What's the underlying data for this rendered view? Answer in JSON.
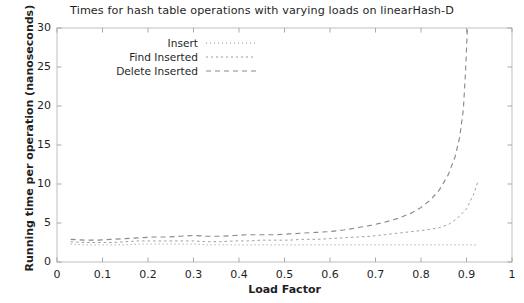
{
  "chart_data": {
    "type": "line",
    "title": "Times for hash table operations with varying loads on linearHash-D",
    "xlabel": "Load Factor",
    "ylabel": "Running time per operation (nanoseconds)",
    "xlim": [
      0,
      1
    ],
    "ylim": [
      0,
      30
    ],
    "xticks": [
      "0",
      "0.1",
      "0.2",
      "0.3",
      "0.4",
      "0.5",
      "0.6",
      "0.7",
      "0.8",
      "0.9",
      "1"
    ],
    "xtick_values": [
      0,
      0.1,
      0.2,
      0.3,
      0.4,
      0.5,
      0.6,
      0.7,
      0.8,
      0.9,
      1
    ],
    "yticks": [
      "0",
      "5",
      "10",
      "15",
      "20",
      "25",
      "30"
    ],
    "ytick_values": [
      0,
      5,
      10,
      15,
      20,
      25,
      30
    ],
    "grid": false,
    "legend_position": "upper-left",
    "legend": [
      "Insert",
      "Find Inserted",
      "Delete Inserted"
    ],
    "series": [
      {
        "name": "Insert",
        "style": "dotted",
        "color": "#8d8d8d",
        "x": [
          0.03,
          0.06,
          0.09,
          0.12,
          0.15,
          0.18,
          0.21,
          0.24,
          0.27,
          0.3,
          0.33,
          0.36,
          0.39,
          0.42,
          0.45,
          0.48,
          0.51,
          0.54,
          0.57,
          0.6,
          0.63,
          0.66,
          0.69,
          0.72,
          0.75,
          0.78,
          0.81,
          0.84,
          0.87,
          0.9,
          0.92
        ],
        "values": [
          2.3,
          2.2,
          2.2,
          2.2,
          2.2,
          2.3,
          2.3,
          2.3,
          2.3,
          2.3,
          2.2,
          2.2,
          2.2,
          2.2,
          2.2,
          2.2,
          2.2,
          2.2,
          2.2,
          2.2,
          2.2,
          2.2,
          2.2,
          2.2,
          2.2,
          2.2,
          2.2,
          2.2,
          2.2,
          2.2,
          2.2
        ]
      },
      {
        "name": "Find Inserted",
        "style": "dashed-fine",
        "color": "#9a9a9a",
        "x": [
          0.03,
          0.06,
          0.09,
          0.12,
          0.15,
          0.18,
          0.21,
          0.24,
          0.27,
          0.3,
          0.33,
          0.36,
          0.39,
          0.42,
          0.45,
          0.48,
          0.51,
          0.54,
          0.57,
          0.6,
          0.63,
          0.66,
          0.69,
          0.72,
          0.75,
          0.78,
          0.81,
          0.84,
          0.86,
          0.88,
          0.9,
          0.915,
          0.925
        ],
        "values": [
          2.6,
          2.5,
          2.5,
          2.5,
          2.6,
          2.7,
          2.7,
          2.7,
          2.7,
          2.7,
          2.6,
          2.6,
          2.7,
          2.7,
          2.8,
          2.8,
          2.8,
          2.9,
          2.9,
          3.0,
          3.1,
          3.2,
          3.3,
          3.5,
          3.7,
          3.9,
          4.1,
          4.4,
          4.8,
          5.6,
          6.8,
          8.6,
          10.3
        ]
      },
      {
        "name": "Delete Inserted",
        "style": "dashed",
        "color": "#8a8a8a",
        "x": [
          0.03,
          0.06,
          0.09,
          0.12,
          0.15,
          0.18,
          0.21,
          0.24,
          0.27,
          0.3,
          0.33,
          0.36,
          0.39,
          0.42,
          0.45,
          0.48,
          0.51,
          0.54,
          0.57,
          0.6,
          0.63,
          0.66,
          0.69,
          0.72,
          0.75,
          0.78,
          0.8,
          0.82,
          0.84,
          0.86,
          0.875,
          0.885,
          0.893,
          0.898,
          0.902
        ],
        "values": [
          2.9,
          2.8,
          2.8,
          2.9,
          3.0,
          3.1,
          3.2,
          3.2,
          3.3,
          3.4,
          3.3,
          3.3,
          3.4,
          3.5,
          3.5,
          3.5,
          3.6,
          3.7,
          3.8,
          3.9,
          4.1,
          4.4,
          4.7,
          5.1,
          5.6,
          6.3,
          7.0,
          7.9,
          9.2,
          11.2,
          13.5,
          16.0,
          19.5,
          24.5,
          30.0
        ]
      }
    ]
  }
}
